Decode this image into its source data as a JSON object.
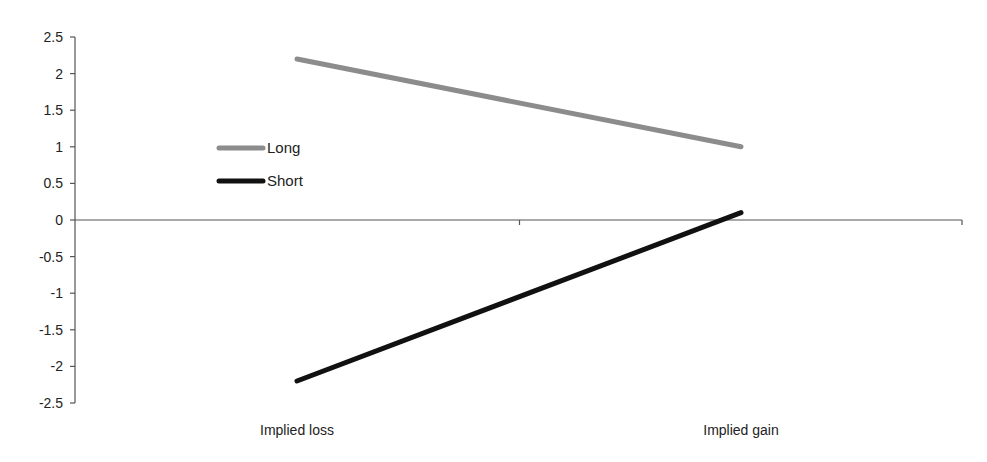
{
  "chart_data": {
    "type": "line",
    "title": "",
    "xlabel": "",
    "ylabel": "",
    "categories": [
      "Implied loss",
      "Implied gain"
    ],
    "series": [
      {
        "name": "Long",
        "values": [
          2.2,
          1.0
        ],
        "color": "#8c8c8c"
      },
      {
        "name": "Short",
        "values": [
          -2.2,
          0.1
        ],
        "color": "#111111"
      }
    ],
    "ylim": [
      -2.5,
      2.5
    ],
    "yticks": [
      2.5,
      2,
      1.5,
      1,
      0.5,
      0,
      -0.5,
      -1,
      -1.5,
      -2,
      -2.5
    ],
    "ytick_labels": [
      "2.5",
      "2",
      "1.5",
      "1",
      "0.5",
      "0",
      "-0.5",
      "-1",
      "-1.5",
      "-2",
      "-2.5"
    ],
    "grid": false,
    "legend_position": "upper-left-inside",
    "x_axis_at": 0
  },
  "legend": {
    "items": [
      {
        "label": "Long",
        "color": "#8c8c8c"
      },
      {
        "label": "Short",
        "color": "#111111"
      }
    ]
  },
  "colors": {
    "axis": "#555555",
    "text": "#222222",
    "background": "#ffffff"
  }
}
